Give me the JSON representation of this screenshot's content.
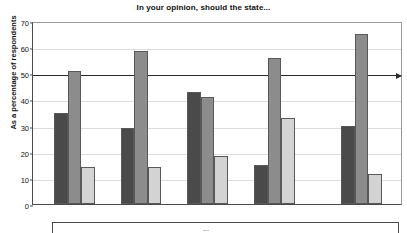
{
  "chart_data": {
    "type": "bar",
    "title": "In your opinion, should the state...",
    "xlabel": "",
    "ylabel": "As a percentage of respondents",
    "ylim": [
      0,
      70
    ],
    "yticks": [
      0,
      10,
      20,
      30,
      40,
      50,
      60,
      70
    ],
    "grid": true,
    "legend_position": "bottom",
    "categories": [
      "France",
      "Germany",
      "Italy",
      "Spain",
      "Hungary"
    ],
    "series": [
      {
        "name": "series-1",
        "color": "#4a4a4a",
        "values": [
          35,
          29,
          43,
          15,
          30
        ]
      },
      {
        "name": "series-2",
        "color": "#8c8c8c",
        "values": [
          51,
          58.5,
          41,
          56,
          65
        ]
      },
      {
        "name": "series-3",
        "color": "#d3d3d3",
        "values": [
          14,
          14,
          18.5,
          33,
          11.5
        ]
      }
    ],
    "annotations": [
      {
        "name": "reference-line",
        "type": "horizontal-line-with-arrow",
        "value": 50
      }
    ]
  },
  "legend": {
    "clipped_text": "..."
  }
}
